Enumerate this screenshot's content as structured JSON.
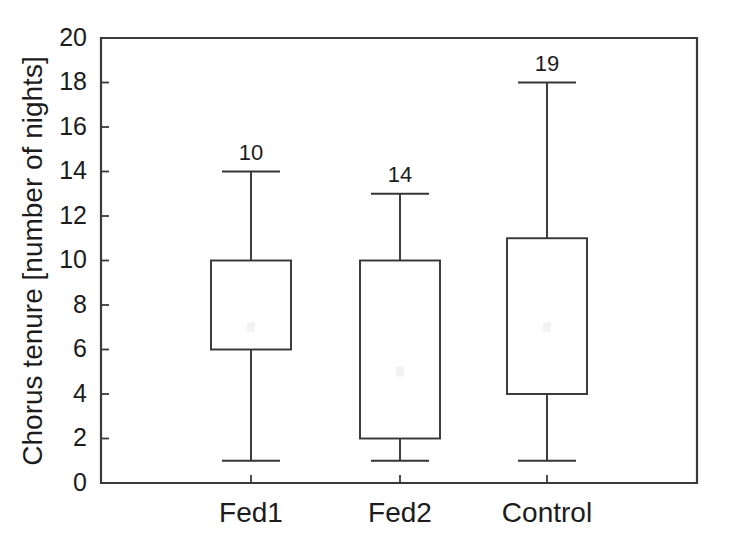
{
  "chart_data": {
    "type": "box",
    "title": "",
    "subtitle": "",
    "xlabel": "",
    "ylabel": "Chorus tenure [number of nights]",
    "categories": [
      "Fed1",
      "Fed2",
      "Control"
    ],
    "ylim": [
      0,
      20
    ],
    "ytick_step": 2,
    "ytick_labels": [
      "0",
      "2",
      "4",
      "6",
      "8",
      "10",
      "12",
      "14",
      "16",
      "18",
      "20"
    ],
    "ytick_values": [
      0,
      2,
      4,
      6,
      8,
      10,
      12,
      14,
      16,
      18,
      20
    ],
    "grid": false,
    "legend": "none",
    "annotation_note": "number above each whisker is the sample size (n)",
    "boxes": [
      {
        "category": "Fed1",
        "whisker_low": 1,
        "q1": 6,
        "median": 7,
        "q3": 10,
        "whisker_high": 14,
        "n_label": "10"
      },
      {
        "category": "Fed2",
        "whisker_low": 1,
        "q1": 2,
        "median": 5,
        "q3": 10,
        "whisker_high": 13,
        "n_label": "14"
      },
      {
        "category": "Control",
        "whisker_low": 1,
        "q1": 4,
        "median": 7,
        "q3": 11,
        "whisker_high": 18,
        "n_label": "19"
      }
    ],
    "colors": {
      "background": "#ffffff",
      "axis": "#3a3a3a",
      "box_stroke": "#353535",
      "box_fill": "#ffffff",
      "text": "#1c1c1c"
    }
  }
}
